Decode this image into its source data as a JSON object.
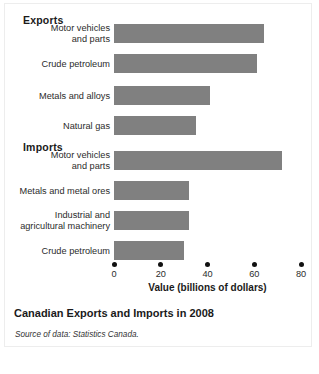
{
  "figure": {
    "caption": "Canadian Exports and Imports in 2008",
    "source_line": "Source of data: Statistics Canada.",
    "bar_color": "#808080",
    "border_color": "#ededed",
    "background": "#ffffff"
  },
  "groups": [
    {
      "heading": "Exports"
    },
    {
      "heading": "Imports"
    }
  ],
  "chart_data": {
    "type": "bar",
    "orientation": "horizontal",
    "title": "Canadian Exports and Imports in 2008",
    "subtitle": "",
    "xlabel": "Value (billions of dollars)",
    "ylabel": "",
    "xlim": [
      0,
      80
    ],
    "xticks": [
      0,
      20,
      40,
      60,
      80
    ],
    "xtick_labels": [
      "0",
      "20",
      "40",
      "60",
      "80"
    ],
    "grid": false,
    "legend": "none",
    "annotations": [
      "Exports",
      "Imports"
    ],
    "groups": [
      {
        "name": "Exports",
        "categories": [
          "Motor vehicles\nand parts",
          "Crude petroleum",
          "Metals and alloys",
          "Natural gas"
        ],
        "values": [
          64,
          61,
          41,
          35
        ]
      },
      {
        "name": "Imports",
        "categories": [
          "Motor vehicles\nand parts",
          "Metals and metal ores",
          "Industrial and\nagricultural machinery",
          "Crude petroleum"
        ],
        "values": [
          72,
          32,
          32,
          30
        ]
      }
    ],
    "bars": [
      {
        "group": "Exports",
        "label": "Motor vehicles\nand parts",
        "value": 64,
        "top": 24,
        "color": "#808080"
      },
      {
        "group": "Exports",
        "label": "Crude petroleum",
        "value": 61,
        "top": 54,
        "color": "#808080"
      },
      {
        "group": "Exports",
        "label": "Metals and alloys",
        "value": 41,
        "top": 86,
        "color": "#808080"
      },
      {
        "group": "Exports",
        "label": "Natural gas",
        "value": 35,
        "top": 116,
        "color": "#808080"
      },
      {
        "group": "Imports",
        "label": "Motor vehicles\nand parts",
        "value": 72,
        "top": 151,
        "color": "#808080"
      },
      {
        "group": "Imports",
        "label": "Metals and metal ores",
        "value": 32,
        "top": 181,
        "color": "#808080"
      },
      {
        "group": "Imports",
        "label": "Industrial and\nagricultural machinery",
        "value": 32,
        "top": 211,
        "color": "#808080"
      },
      {
        "group": "Imports",
        "label": "Crude petroleum",
        "value": 30,
        "top": 241,
        "color": "#808080"
      }
    ]
  }
}
